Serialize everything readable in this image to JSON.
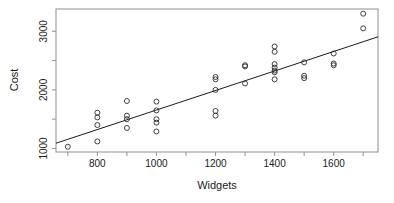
{
  "chart_data": {
    "type": "scatter",
    "title": "",
    "xlabel": "Widgets",
    "ylabel": "Cost",
    "xlim": [
      660,
      1750
    ],
    "ylim": [
      940,
      3380
    ],
    "grid": false,
    "legend": null,
    "x_ticks": [
      800,
      1000,
      1200,
      1400,
      1600
    ],
    "x_tick_labels": [
      "800",
      "1000",
      "1200",
      "1400",
      "1600"
    ],
    "x_minor_ticks": [
      700,
      900,
      1100,
      1300,
      1500,
      1700
    ],
    "y_ticks": [
      1000,
      2000,
      3000
    ],
    "y_tick_labels": [
      "1000",
      "2000",
      "3000"
    ],
    "y_minor_ticks": [
      1500,
      2500
    ],
    "marker": "open-circle",
    "points": [
      {
        "x": 700,
        "y": 1030
      },
      {
        "x": 800,
        "y": 1120
      },
      {
        "x": 800,
        "y": 1400
      },
      {
        "x": 800,
        "y": 1530
      },
      {
        "x": 800,
        "y": 1610
      },
      {
        "x": 900,
        "y": 1350
      },
      {
        "x": 900,
        "y": 1500
      },
      {
        "x": 900,
        "y": 1560
      },
      {
        "x": 900,
        "y": 1810
      },
      {
        "x": 1000,
        "y": 1290
      },
      {
        "x": 1000,
        "y": 1440
      },
      {
        "x": 1000,
        "y": 1500
      },
      {
        "x": 1000,
        "y": 1650
      },
      {
        "x": 1000,
        "y": 1800
      },
      {
        "x": 1200,
        "y": 1560
      },
      {
        "x": 1200,
        "y": 1640
      },
      {
        "x": 1200,
        "y": 2000
      },
      {
        "x": 1200,
        "y": 2180
      },
      {
        "x": 1200,
        "y": 2220
      },
      {
        "x": 1300,
        "y": 2110
      },
      {
        "x": 1300,
        "y": 2400
      },
      {
        "x": 1300,
        "y": 2420
      },
      {
        "x": 1400,
        "y": 2180
      },
      {
        "x": 1400,
        "y": 2300
      },
      {
        "x": 1400,
        "y": 2330
      },
      {
        "x": 1400,
        "y": 2380
      },
      {
        "x": 1400,
        "y": 2440
      },
      {
        "x": 1400,
        "y": 2650
      },
      {
        "x": 1400,
        "y": 2740
      },
      {
        "x": 1500,
        "y": 2200
      },
      {
        "x": 1500,
        "y": 2240
      },
      {
        "x": 1500,
        "y": 2470
      },
      {
        "x": 1600,
        "y": 2420
      },
      {
        "x": 1600,
        "y": 2450
      },
      {
        "x": 1600,
        "y": 2620
      },
      {
        "x": 1700,
        "y": 3050
      },
      {
        "x": 1700,
        "y": 3300
      }
    ],
    "fit_line": {
      "x_start": 660,
      "y_start": 1090,
      "x_end": 1750,
      "y_end": 2905
    },
    "colors": {
      "marker_stroke": "#2b2b2b",
      "fit_line": "#1a1a1a",
      "frame": "#9a9a9a",
      "text": "#1a1a1a",
      "background": "#ffffff"
    }
  }
}
